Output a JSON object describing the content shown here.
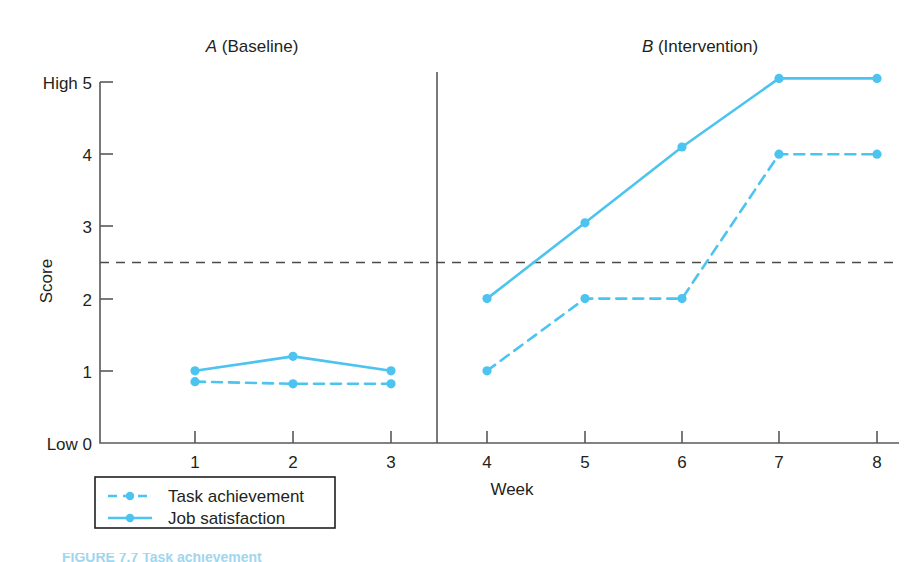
{
  "figure": {
    "caption_partial": "FIGURE 7.7  Task achievement",
    "accent_color": "#4dc3f0",
    "axis_color": "#58595b",
    "text_color": "#231f20"
  },
  "chart_data": {
    "type": "line",
    "title": "",
    "xlabel": "Week",
    "ylabel": "Score",
    "x": [
      1,
      2,
      3,
      4,
      5,
      6,
      7,
      8
    ],
    "xtick_labels": [
      "1",
      "2",
      "3",
      "4",
      "5",
      "6",
      "7",
      "8"
    ],
    "ytick_labels": [
      "Low 0",
      "1",
      "2",
      "3",
      "4",
      "High 5"
    ],
    "ytick_values": [
      0,
      1,
      2,
      3,
      4,
      5
    ],
    "ylim": [
      0,
      5
    ],
    "xlim": [
      0.5,
      8.4
    ],
    "grid": false,
    "legend_position": "below-left",
    "phases": [
      {
        "id": "A",
        "letter": "A",
        "name": "(Baseline)",
        "weeks": [
          1,
          2,
          3
        ]
      },
      {
        "id": "B",
        "letter": "B",
        "name": "(Intervention)",
        "weeks": [
          4,
          5,
          6,
          7,
          8
        ]
      }
    ],
    "phase_divider_x": 3.5,
    "criterion_line": {
      "value": 2.5,
      "style": "dashed",
      "color": "#4a4a4a"
    },
    "series": [
      {
        "name": "Task achievement",
        "style": "dashed",
        "color": "#4dc3f0",
        "segments": [
          {
            "phase": "A",
            "x": [
              1,
              2,
              3
            ],
            "values": [
              0.85,
              0.82,
              0.82
            ]
          },
          {
            "phase": "B",
            "x": [
              4,
              5,
              6,
              7,
              8
            ],
            "values": [
              1.0,
              2.0,
              2.0,
              4.0,
              4.0
            ]
          }
        ]
      },
      {
        "name": "Job satisfaction",
        "style": "solid",
        "color": "#4dc3f0",
        "segments": [
          {
            "phase": "A",
            "x": [
              1,
              2,
              3
            ],
            "values": [
              1.0,
              1.2,
              1.0
            ]
          },
          {
            "phase": "B",
            "x": [
              4,
              5,
              6,
              7,
              8
            ],
            "values": [
              2.0,
              3.05,
              4.1,
              5.05,
              5.05
            ]
          }
        ]
      }
    ]
  },
  "legend": {
    "items": [
      {
        "label": "Task achievement",
        "style": "dashed"
      },
      {
        "label": "Job satisfaction",
        "style": "solid"
      }
    ]
  }
}
